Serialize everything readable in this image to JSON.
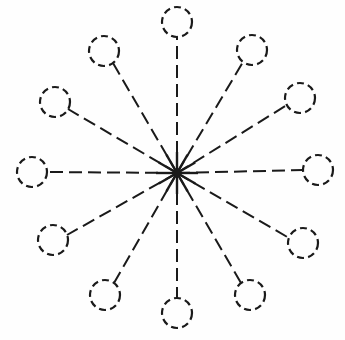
{
  "figure": {
    "style": {
      "background_color": "#fefefe",
      "ink_color": "#1a1a1a",
      "stroke_width": 2,
      "node_stroke_width": 2.2,
      "dash_pattern": "13 6",
      "node_dash_pattern": "7 4.2"
    },
    "canvas": {
      "width": 345,
      "height": 340
    },
    "hub": {
      "label": "central-hub",
      "cx": 177,
      "cy": 173,
      "ray_length": 21,
      "core_radius": 4.5
    },
    "node_radius": 15,
    "nodes": [
      {
        "id": "node-01",
        "label": "top",
        "angle_deg": 270,
        "cx": 177,
        "cy": 22,
        "attach_x": 177,
        "attach_y": 37
      },
      {
        "id": "node-02",
        "label": "upper-right",
        "angle_deg": 300,
        "cx": 252,
        "cy": 50,
        "attach_x": 243,
        "attach_y": 62
      },
      {
        "id": "node-03",
        "label": "right-upper",
        "angle_deg": 330,
        "cx": 300,
        "cy": 98,
        "attach_x": 287,
        "attach_y": 105
      },
      {
        "id": "node-04",
        "label": "right",
        "angle_deg": 0,
        "cx": 318,
        "cy": 170,
        "attach_x": 303,
        "attach_y": 170
      },
      {
        "id": "node-05",
        "label": "right-lower",
        "angle_deg": 30,
        "cx": 303,
        "cy": 243,
        "attach_x": 289,
        "attach_y": 238
      },
      {
        "id": "node-06",
        "label": "lower-right",
        "angle_deg": 60,
        "cx": 250,
        "cy": 295,
        "attach_x": 241,
        "attach_y": 283
      },
      {
        "id": "node-07",
        "label": "bottom",
        "angle_deg": 90,
        "cx": 177,
        "cy": 313,
        "attach_x": 177,
        "attach_y": 298
      },
      {
        "id": "node-08",
        "label": "lower-left",
        "angle_deg": 120,
        "cx": 105,
        "cy": 295,
        "attach_x": 114,
        "attach_y": 283
      },
      {
        "id": "node-09",
        "label": "left-lower",
        "angle_deg": 150,
        "cx": 53,
        "cy": 240,
        "attach_x": 67,
        "attach_y": 235
      },
      {
        "id": "node-10",
        "label": "left",
        "angle_deg": 180,
        "cx": 32,
        "cy": 172,
        "attach_x": 47,
        "attach_y": 172
      },
      {
        "id": "node-11",
        "label": "left-upper",
        "angle_deg": 210,
        "cx": 55,
        "cy": 102,
        "attach_x": 68,
        "attach_y": 109
      },
      {
        "id": "node-12",
        "label": "upper-left",
        "angle_deg": 240,
        "cx": 104,
        "cy": 51,
        "attach_x": 113,
        "attach_y": 63
      }
    ]
  },
  "chart_data": {
    "type": "diagram",
    "subtype": "star-topology-graph",
    "node_count": 12,
    "edge_count": 12,
    "center": {
      "x": 177,
      "y": 173
    },
    "node_radius": 15,
    "ring_radius_px": 147,
    "angular_spacing_deg": 30,
    "nodes": [
      {
        "id": "node-01",
        "angle_deg": 270,
        "x": 177,
        "y": 22
      },
      {
        "id": "node-02",
        "angle_deg": 300,
        "x": 252,
        "y": 50
      },
      {
        "id": "node-03",
        "angle_deg": 330,
        "x": 300,
        "y": 98
      },
      {
        "id": "node-04",
        "angle_deg": 0,
        "x": 318,
        "y": 170
      },
      {
        "id": "node-05",
        "angle_deg": 30,
        "x": 303,
        "y": 243
      },
      {
        "id": "node-06",
        "angle_deg": 60,
        "x": 250,
        "y": 295
      },
      {
        "id": "node-07",
        "angle_deg": 90,
        "x": 177,
        "y": 313
      },
      {
        "id": "node-08",
        "angle_deg": 120,
        "x": 105,
        "y": 295
      },
      {
        "id": "node-09",
        "angle_deg": 150,
        "x": 53,
        "y": 240
      },
      {
        "id": "node-10",
        "angle_deg": 180,
        "x": 32,
        "y": 172
      },
      {
        "id": "node-11",
        "angle_deg": 210,
        "x": 55,
        "y": 102
      },
      {
        "id": "node-12",
        "angle_deg": 240,
        "x": 104,
        "y": 51
      }
    ],
    "edges": [
      {
        "from": "hub",
        "to": "node-01"
      },
      {
        "from": "hub",
        "to": "node-02"
      },
      {
        "from": "hub",
        "to": "node-03"
      },
      {
        "from": "hub",
        "to": "node-04"
      },
      {
        "from": "hub",
        "to": "node-05"
      },
      {
        "from": "hub",
        "to": "node-06"
      },
      {
        "from": "hub",
        "to": "node-07"
      },
      {
        "from": "hub",
        "to": "node-08"
      },
      {
        "from": "hub",
        "to": "node-09"
      },
      {
        "from": "hub",
        "to": "node-10"
      },
      {
        "from": "hub",
        "to": "node-11"
      },
      {
        "from": "hub",
        "to": "node-12"
      }
    ],
    "legend": [],
    "annotations": [],
    "xlabel": "",
    "ylabel": "",
    "grid": false
  }
}
